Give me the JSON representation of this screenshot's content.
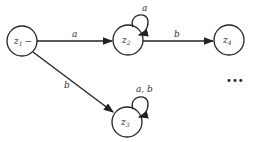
{
  "diagram": {
    "type": "finite-automaton",
    "states": [
      {
        "id": "z1",
        "name": "z",
        "sub": "1",
        "suffix": "−",
        "x": 22,
        "y": 41
      },
      {
        "id": "z2",
        "name": "z",
        "sub": "2",
        "suffix": "",
        "x": 128,
        "y": 40
      },
      {
        "id": "z3",
        "name": "z",
        "sub": "3",
        "suffix": "",
        "x": 127,
        "y": 122
      },
      {
        "id": "z4",
        "name": "z",
        "sub": "4",
        "suffix": "",
        "x": 229,
        "y": 40
      }
    ],
    "transitions": [
      {
        "from": "z1",
        "to": "z2",
        "label": "a"
      },
      {
        "from": "z2",
        "to": "z2",
        "label": "a"
      },
      {
        "from": "z2",
        "to": "z4",
        "label": "b"
      },
      {
        "from": "z1",
        "to": "z3",
        "label": "b"
      },
      {
        "from": "z3",
        "to": "z3",
        "label": "a, b"
      }
    ],
    "ellipsis": "•••"
  }
}
